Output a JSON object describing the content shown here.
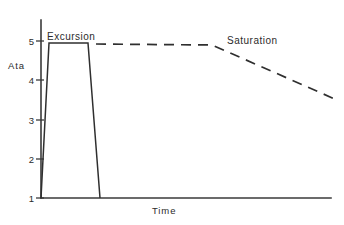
{
  "chart_data": {
    "type": "line",
    "title": "",
    "xlabel": "Time",
    "ylabel": "Ata",
    "ylim": [
      1,
      5.4
    ],
    "yticks": [
      1,
      2,
      3,
      4,
      5
    ],
    "ytick_labels": [
      "1",
      "2",
      "3",
      "4",
      "5"
    ],
    "xticks": [],
    "xtick_labels": [],
    "grid": false,
    "legend_position": "inline-annotations",
    "annotations": [
      {
        "text": "Excursion",
        "x_px": 47,
        "y_px": 31
      },
      {
        "text": "Saturation",
        "x_px": 227,
        "y_px": 35
      }
    ],
    "series": [
      {
        "name": "Excursion",
        "style": "solid",
        "points": [
          {
            "x_px": 41,
            "y_px": 198,
            "value": 1.0
          },
          {
            "x_px": 49,
            "y_px": 43,
            "value": 5.0
          },
          {
            "x_px": 88,
            "y_px": 43,
            "value": 5.0
          },
          {
            "x_px": 100,
            "y_px": 198,
            "value": 1.0
          }
        ]
      },
      {
        "name": "Saturation",
        "style": "dashed",
        "points": [
          {
            "x_px": 96,
            "y_px": 44,
            "value": 5.0
          },
          {
            "x_px": 212,
            "y_px": 45,
            "value": 5.0
          },
          {
            "x_px": 337,
            "y_px": 100,
            "value": 3.65
          }
        ]
      }
    ],
    "axes_geometry": {
      "y_axis_x_px": 41,
      "y_axis_top_px": 20,
      "x_axis_y_px": 198,
      "x_axis_right_px": 331,
      "tick_pixel_y": [
        198,
        159,
        120,
        80,
        41
      ]
    }
  },
  "labels": {
    "y_axis_title": "Ata",
    "x_axis_title": "Time",
    "excursion": "Excursion",
    "saturation": "Saturation",
    "ytick_1": "1",
    "ytick_2": "2",
    "ytick_3": "3",
    "ytick_4": "4",
    "ytick_5": "5"
  },
  "colors": {
    "ink": "#2f2f2f",
    "axis": "#3a3a3a",
    "background": "#ffffff"
  }
}
